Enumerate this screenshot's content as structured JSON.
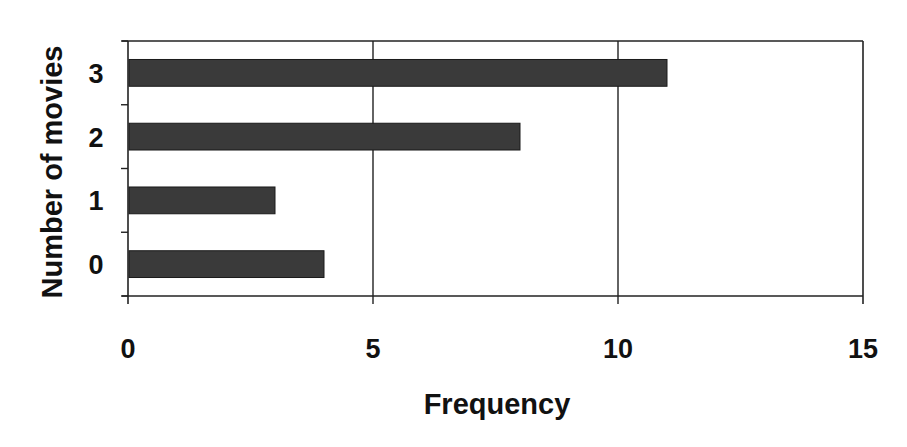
{
  "chart_data": {
    "type": "bar",
    "orientation": "horizontal",
    "title": "",
    "xlabel": "Frequency",
    "ylabel": "Number of movies",
    "categories": [
      "0",
      "1",
      "2",
      "3"
    ],
    "values": [
      4,
      3,
      8,
      11
    ],
    "xlim": [
      0,
      15
    ],
    "xticks": [
      0,
      5,
      10,
      15
    ],
    "grid": {
      "vertical": true,
      "horizontal": false
    },
    "legend": null,
    "bar_color": "#3a3a3a",
    "axis_color": "#222222"
  }
}
